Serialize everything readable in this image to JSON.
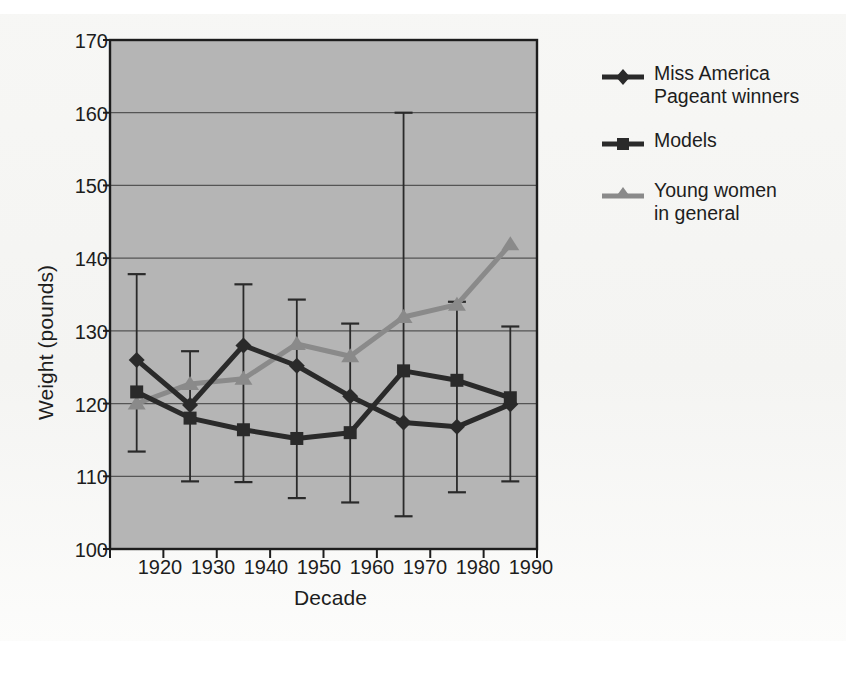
{
  "chart_data": {
    "type": "line",
    "title": "",
    "xlabel": "Decade",
    "ylabel": "Weight (pounds)",
    "categories": [
      "1920",
      "1930",
      "1940",
      "1950",
      "1960",
      "1970",
      "1980",
      "1990"
    ],
    "ylim": [
      100,
      170
    ],
    "yticks": [
      100,
      110,
      120,
      130,
      140,
      150,
      160,
      170
    ],
    "grid": "horizontal",
    "legend_position": "right",
    "series": [
      {
        "name": "Miss America\nPageant winners",
        "marker": "diamond",
        "color": "#2a2a2a",
        "values": [
          126.0,
          119.8,
          128.0,
          125.2,
          121.0,
          117.4,
          116.8,
          119.9
        ],
        "error_low": [
          113.4,
          109.3,
          109.2,
          107.0,
          106.4,
          104.5,
          107.8,
          109.3
        ],
        "error_high": [
          137.8,
          127.2,
          136.4,
          134.3,
          131.0,
          160.0,
          134.0,
          130.6
        ]
      },
      {
        "name": "Models",
        "marker": "square",
        "color": "#2a2a2a",
        "values": [
          121.6,
          118.0,
          116.4,
          115.2,
          116.0,
          124.5,
          123.2,
          120.8
        ],
        "error_low": [
          null,
          null,
          null,
          null,
          null,
          null,
          null,
          null
        ],
        "error_high": [
          null,
          null,
          null,
          null,
          null,
          null,
          null,
          null
        ]
      },
      {
        "name": "Young women\nin general",
        "marker": "triangle",
        "color": "#8a8a8a",
        "values": [
          120.0,
          122.7,
          123.4,
          128.2,
          126.5,
          131.9,
          133.6,
          141.9
        ],
        "error_low": [
          null,
          null,
          null,
          null,
          null,
          null,
          null,
          null
        ],
        "error_high": [
          null,
          null,
          null,
          null,
          null,
          null,
          null,
          null
        ]
      }
    ],
    "colors": {
      "plot_background": "#b5b5b5",
      "page_background": "#f5f5f3",
      "axis": "#1d1d1d",
      "gridline": "#555555",
      "dark_series": "#2a2a2a",
      "gray_series": "#8a8a8a"
    }
  },
  "legend": {
    "items": [
      {
        "label": "Miss America\nPageant winners",
        "marker": "diamond-marker-icon"
      },
      {
        "label": "Models",
        "marker": "square-marker-icon"
      },
      {
        "label": "Young women\nin general",
        "marker": "triangle-marker-icon"
      }
    ]
  },
  "axes": {
    "y_title": "Weight (pounds)",
    "x_title": "Decade",
    "y_ticks": [
      "170",
      "160",
      "150",
      "140",
      "130",
      "120",
      "110",
      "100"
    ],
    "x_ticks": [
      "1920",
      "1930",
      "1940",
      "1950",
      "1960",
      "1970",
      "1980",
      "1990"
    ]
  }
}
